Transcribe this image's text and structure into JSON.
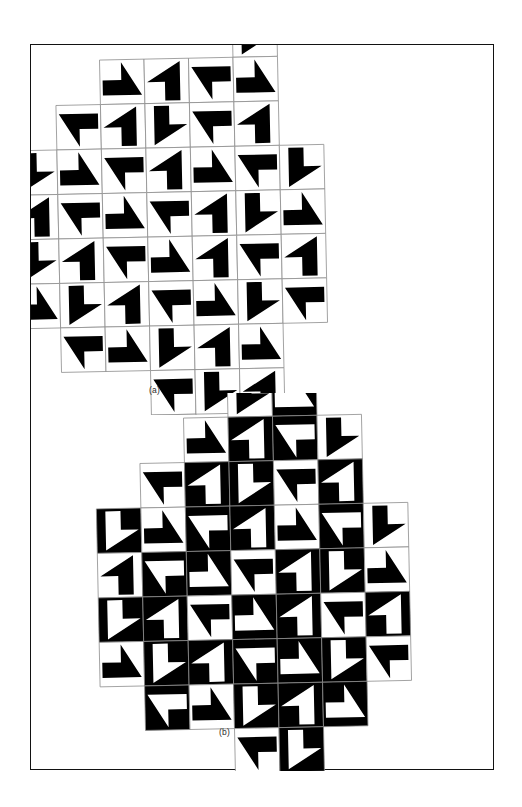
{
  "figure": {
    "background_color": "#ffffff",
    "frame_color": "#121212",
    "ink_color": "#000000",
    "tile_outline_color": "#8c8c8c",
    "width": 522,
    "height": 807
  },
  "panels": [
    {
      "id": "a",
      "caption": "(a)",
      "tile_size": 44.5,
      "rotation_deg": -1.2,
      "origin_x": 24,
      "origin_y": 16,
      "description": "Monochrome flag-motif tiling, black figures on white tiles",
      "tiles": [
        {
          "col": 1,
          "row": 0,
          "rot": 90,
          "inv": false
        },
        {
          "col": 2,
          "row": 0,
          "rot": 0,
          "inv": false
        },
        {
          "col": 3,
          "row": 0,
          "rot": 270,
          "inv": false
        },
        {
          "col": 4,
          "row": -1,
          "rot": 180,
          "inv": false
        },
        {
          "col": 4,
          "row": 0,
          "rot": 90,
          "inv": false
        },
        {
          "col": 0,
          "row": 1,
          "rot": 270,
          "inv": false
        },
        {
          "col": 1,
          "row": 1,
          "rot": 0,
          "inv": false
        },
        {
          "col": 2,
          "row": 1,
          "rot": 180,
          "inv": false
        },
        {
          "col": 3,
          "row": 1,
          "rot": 270,
          "inv": false
        },
        {
          "col": 4,
          "row": 1,
          "rot": 0,
          "inv": false
        },
        {
          "col": -1,
          "row": 2,
          "rot": 180,
          "inv": false
        },
        {
          "col": 0,
          "row": 2,
          "rot": 90,
          "inv": false
        },
        {
          "col": 1,
          "row": 2,
          "rot": 270,
          "inv": false
        },
        {
          "col": 2,
          "row": 2,
          "rot": 0,
          "inv": false
        },
        {
          "col": 3,
          "row": 2,
          "rot": 90,
          "inv": false
        },
        {
          "col": 4,
          "row": 2,
          "rot": 270,
          "inv": false
        },
        {
          "col": 5,
          "row": 2,
          "rot": 180,
          "inv": false
        },
        {
          "col": -1,
          "row": 3,
          "rot": 0,
          "inv": false
        },
        {
          "col": 0,
          "row": 3,
          "rot": 270,
          "inv": false
        },
        {
          "col": 1,
          "row": 3,
          "rot": 90,
          "inv": false
        },
        {
          "col": 2,
          "row": 3,
          "rot": 270,
          "inv": false
        },
        {
          "col": 3,
          "row": 3,
          "rot": 0,
          "inv": false
        },
        {
          "col": 4,
          "row": 3,
          "rot": 180,
          "inv": false
        },
        {
          "col": 5,
          "row": 3,
          "rot": 90,
          "inv": false
        },
        {
          "col": -1,
          "row": 4,
          "rot": 180,
          "inv": false
        },
        {
          "col": 0,
          "row": 4,
          "rot": 0,
          "inv": false
        },
        {
          "col": 1,
          "row": 4,
          "rot": 270,
          "inv": false
        },
        {
          "col": 2,
          "row": 4,
          "rot": 90,
          "inv": false
        },
        {
          "col": 3,
          "row": 4,
          "rot": 0,
          "inv": false
        },
        {
          "col": 4,
          "row": 4,
          "rot": 270,
          "inv": false
        },
        {
          "col": 5,
          "row": 4,
          "rot": 0,
          "inv": false
        },
        {
          "col": -1,
          "row": 5,
          "rot": 90,
          "inv": false
        },
        {
          "col": 0,
          "row": 5,
          "rot": 180,
          "inv": false
        },
        {
          "col": 1,
          "row": 5,
          "rot": 0,
          "inv": false
        },
        {
          "col": 2,
          "row": 5,
          "rot": 270,
          "inv": false
        },
        {
          "col": 3,
          "row": 5,
          "rot": 90,
          "inv": false
        },
        {
          "col": 4,
          "row": 5,
          "rot": 180,
          "inv": false
        },
        {
          "col": 5,
          "row": 5,
          "rot": 270,
          "inv": false
        },
        {
          "col": 0,
          "row": 6,
          "rot": 270,
          "inv": false
        },
        {
          "col": 1,
          "row": 6,
          "rot": 90,
          "inv": false
        },
        {
          "col": 2,
          "row": 6,
          "rot": 180,
          "inv": false
        },
        {
          "col": 3,
          "row": 6,
          "rot": 0,
          "inv": false
        },
        {
          "col": 4,
          "row": 6,
          "rot": 90,
          "inv": false
        },
        {
          "col": 2,
          "row": 7,
          "rot": 270,
          "inv": false
        },
        {
          "col": 3,
          "row": 7,
          "rot": 180,
          "inv": false
        },
        {
          "col": 4,
          "row": 7,
          "rot": 0,
          "inv": false
        },
        {
          "col": 2,
          "row": 8,
          "rot": 0,
          "inv": false
        }
      ]
    },
    {
      "id": "b",
      "caption": "(b)",
      "tile_size": 44.5,
      "rotation_deg": -1.2,
      "origin_x": 108,
      "origin_y": 26,
      "description": "Same flag-motif tiling with alternating inverted (white-on-black) tiles",
      "tiles": [
        {
          "col": 2,
          "row": -1,
          "rot": 180,
          "inv": false
        },
        {
          "col": 3,
          "row": -1,
          "rot": 90,
          "inv": true
        },
        {
          "col": 1,
          "row": 0,
          "rot": 90,
          "inv": false
        },
        {
          "col": 2,
          "row": 0,
          "rot": 0,
          "inv": true
        },
        {
          "col": 3,
          "row": 0,
          "rot": 270,
          "inv": true
        },
        {
          "col": 4,
          "row": 0,
          "rot": 180,
          "inv": false
        },
        {
          "col": 0,
          "row": 1,
          "rot": 270,
          "inv": false
        },
        {
          "col": 1,
          "row": 1,
          "rot": 0,
          "inv": true
        },
        {
          "col": 2,
          "row": 1,
          "rot": 180,
          "inv": true
        },
        {
          "col": 3,
          "row": 1,
          "rot": 270,
          "inv": false
        },
        {
          "col": 4,
          "row": 1,
          "rot": 0,
          "inv": true
        },
        {
          "col": -1,
          "row": 2,
          "rot": 180,
          "inv": true
        },
        {
          "col": 0,
          "row": 2,
          "rot": 90,
          "inv": false
        },
        {
          "col": 1,
          "row": 2,
          "rot": 270,
          "inv": true
        },
        {
          "col": 2,
          "row": 2,
          "rot": 0,
          "inv": true
        },
        {
          "col": 3,
          "row": 2,
          "rot": 90,
          "inv": false
        },
        {
          "col": 4,
          "row": 2,
          "rot": 270,
          "inv": true
        },
        {
          "col": 5,
          "row": 2,
          "rot": 180,
          "inv": false
        },
        {
          "col": -1,
          "row": 3,
          "rot": 0,
          "inv": false
        },
        {
          "col": 0,
          "row": 3,
          "rot": 270,
          "inv": true
        },
        {
          "col": 1,
          "row": 3,
          "rot": 90,
          "inv": true
        },
        {
          "col": 2,
          "row": 3,
          "rot": 270,
          "inv": false
        },
        {
          "col": 3,
          "row": 3,
          "rot": 0,
          "inv": true
        },
        {
          "col": 4,
          "row": 3,
          "rot": 180,
          "inv": true
        },
        {
          "col": 5,
          "row": 3,
          "rot": 90,
          "inv": false
        },
        {
          "col": -1,
          "row": 4,
          "rot": 180,
          "inv": true
        },
        {
          "col": 0,
          "row": 4,
          "rot": 0,
          "inv": true
        },
        {
          "col": 1,
          "row": 4,
          "rot": 270,
          "inv": false
        },
        {
          "col": 2,
          "row": 4,
          "rot": 90,
          "inv": true
        },
        {
          "col": 3,
          "row": 4,
          "rot": 0,
          "inv": true
        },
        {
          "col": 4,
          "row": 4,
          "rot": 270,
          "inv": false
        },
        {
          "col": 5,
          "row": 4,
          "rot": 0,
          "inv": true
        },
        {
          "col": -1,
          "row": 5,
          "rot": 90,
          "inv": false
        },
        {
          "col": 0,
          "row": 5,
          "rot": 180,
          "inv": true
        },
        {
          "col": 1,
          "row": 5,
          "rot": 0,
          "inv": true
        },
        {
          "col": 2,
          "row": 5,
          "rot": 270,
          "inv": true
        },
        {
          "col": 3,
          "row": 5,
          "rot": 90,
          "inv": true
        },
        {
          "col": 4,
          "row": 5,
          "rot": 180,
          "inv": true
        },
        {
          "col": 5,
          "row": 5,
          "rot": 270,
          "inv": false
        },
        {
          "col": 0,
          "row": 6,
          "rot": 270,
          "inv": true
        },
        {
          "col": 1,
          "row": 6,
          "rot": 90,
          "inv": false
        },
        {
          "col": 2,
          "row": 6,
          "rot": 180,
          "inv": true
        },
        {
          "col": 3,
          "row": 6,
          "rot": 0,
          "inv": true
        },
        {
          "col": 4,
          "row": 6,
          "rot": 90,
          "inv": true
        },
        {
          "col": 2,
          "row": 7,
          "rot": 270,
          "inv": false
        },
        {
          "col": 3,
          "row": 7,
          "rot": 180,
          "inv": true
        }
      ]
    }
  ]
}
